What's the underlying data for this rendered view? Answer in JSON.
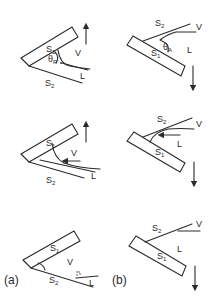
{
  "figure": {
    "panel_labels": {
      "a": "(a)",
      "b": "(b)"
    },
    "column_a": {
      "motion": "up",
      "rows": [
        {
          "solid_top": "S",
          "solid_top_sub": "1",
          "solid_bottom": "S",
          "solid_bottom_sub": "2",
          "vapor": "V",
          "liquid": "L",
          "angle": "θ",
          "angle_sub": "R"
        },
        {
          "solid_top": "S",
          "solid_top_sub": "1",
          "solid_bottom": "S",
          "solid_bottom_sub": "2",
          "vapor": "V",
          "liquid": "L"
        },
        {
          "solid_top": "S",
          "solid_top_sub": "1",
          "solid_bottom": "S",
          "solid_bottom_sub": "2",
          "vapor": "V",
          "liquid": "L"
        }
      ]
    },
    "column_b": {
      "motion": "down",
      "rows": [
        {
          "solid_top": "S",
          "solid_top_sub": "2",
          "solid_bottom": "S",
          "solid_bottom_sub": "1",
          "vapor": "V",
          "liquid": "L",
          "angle": "θ",
          "angle_sub": "A"
        },
        {
          "solid_top": "S",
          "solid_top_sub": "2",
          "solid_bottom": "S",
          "solid_bottom_sub": "1",
          "vapor": "V",
          "liquid": "L"
        },
        {
          "solid_top": "S",
          "solid_top_sub": "2",
          "solid_bottom": "S",
          "solid_bottom_sub": "1",
          "vapor": "V",
          "liquid": "L"
        }
      ]
    }
  }
}
